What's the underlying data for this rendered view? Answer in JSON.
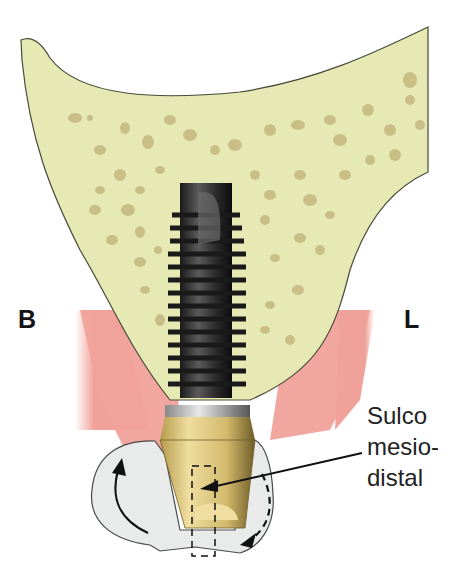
{
  "diagram": {
    "title": "",
    "labels": {
      "buccal": "B",
      "lingual": "L",
      "callout_line1": "Sulco",
      "callout_line2": "mesio-",
      "callout_line3": "distal"
    },
    "components": [
      "bone",
      "gingiva",
      "implant",
      "abutment",
      "crown",
      "rotation-arrow-solid",
      "rotation-arrow-dashed",
      "mesiodistal-groove"
    ],
    "colors": {
      "bone": "#e6e9b3",
      "bone_pores": "#c9bf86",
      "gingiva": "#f0a29a",
      "implant": "#2e2e2e",
      "collar": "#c8c8c8",
      "abutment": "#d8c27a",
      "crown": "#e9eaea",
      "text": "#141414"
    }
  }
}
